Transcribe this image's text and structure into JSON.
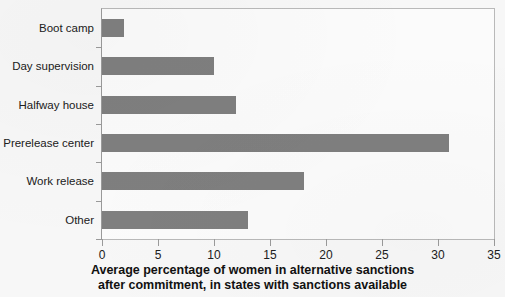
{
  "chart_data": {
    "type": "bar",
    "orientation": "horizontal",
    "title": "",
    "xlabel": "Average percentage of women in alternative sanctions after commitment, in states with sanctions available",
    "xlabel_lines": [
      "Average percentage of women in alternative sanctions",
      "after commitment, in states with sanctions available"
    ],
    "ylabel": "",
    "categories": [
      "Boot camp",
      "Day supervision",
      "Halfway house",
      "Prerelease center",
      "Work release",
      "Other"
    ],
    "values": [
      2,
      10,
      12,
      31,
      18,
      13
    ],
    "xlim": [
      0,
      35
    ],
    "xticks": [
      0,
      5,
      10,
      15,
      20,
      25,
      30,
      35
    ],
    "xtick_labels": [
      "0",
      "5",
      "10",
      "15",
      "20",
      "25",
      "30",
      "35"
    ],
    "grid": false,
    "legend": null,
    "bar_color": "#7f7f7f",
    "axis_color": "#9a9a9a",
    "background_color": "#f7f7f7"
  }
}
